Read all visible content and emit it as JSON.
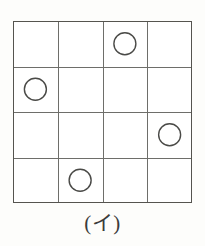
{
  "figure": {
    "caption": "(イ)",
    "grid": {
      "rows": 4,
      "cols": 4,
      "line_color": "#6e6e6a",
      "border_color": "#55544f",
      "background": "#ffffff",
      "line_width": 1,
      "border_width": 1.4
    },
    "circles": {
      "count": 4,
      "stroke_color": "#4a4a47",
      "fill": "none",
      "radius": 11,
      "stroke_width": 1.4,
      "cells": [
        {
          "row": 1,
          "col": 3,
          "label": "circle-r1c3"
        },
        {
          "row": 2,
          "col": 1,
          "label": "circle-r2c1"
        },
        {
          "row": 3,
          "col": 4,
          "label": "circle-r3c4"
        },
        {
          "row": 4,
          "col": 2,
          "label": "circle-r4c2"
        }
      ]
    },
    "page": {
      "background": "#fdfdfb",
      "width": 205,
      "height": 246
    }
  }
}
